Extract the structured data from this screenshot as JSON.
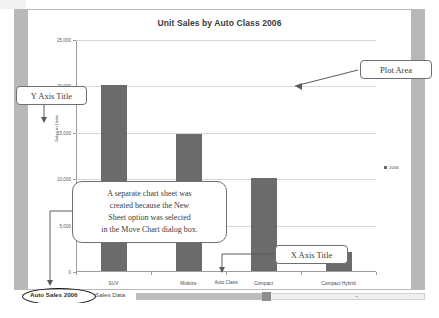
{
  "chart_data": {
    "type": "bar",
    "title": "Unit Sales by Auto Class 2006",
    "categories": [
      "SUV",
      "Midsize",
      "Compact",
      "Compact Hybrid"
    ],
    "values": [
      20000,
      14800,
      10000,
      2000
    ],
    "series": [
      {
        "name": "2006",
        "values": [
          20000,
          14800,
          10000,
          2000
        ]
      }
    ],
    "xlabel": "Auto Class",
    "ylabel": "Sales in Units",
    "ylim": [
      0,
      25000
    ],
    "yticks": [
      0,
      5000,
      10000,
      15000,
      20000,
      25000
    ],
    "ytick_labels": [
      "0",
      "5,000",
      "10,000",
      "15,000",
      "20,000",
      "25,000"
    ],
    "grid": true,
    "legend_position": "right",
    "bar_color": "#6b6b6b"
  },
  "chart": {
    "title": "Unit Sales by Auto Class 2006",
    "y_axis_title": "Sales in Units",
    "x_axis_title": "Auto Class",
    "legend": [
      {
        "label": "2006",
        "color": "#6b6b6b"
      }
    ]
  },
  "annotations": {
    "plot_area": "Plot Area",
    "y_axis_title": "Y Axis Title",
    "x_axis_title": "X Axis Title",
    "note_lines": [
      "A separate chart sheet was",
      "created because the New",
      "Sheet option was selected",
      "in the Move Chart dialog box."
    ]
  },
  "tabs": {
    "items": [
      {
        "label": "Auto Sales 2006",
        "active": true
      },
      {
        "label": "Sales Data",
        "active": false
      }
    ],
    "add_sheet_icon": "add-sheet-icon"
  }
}
